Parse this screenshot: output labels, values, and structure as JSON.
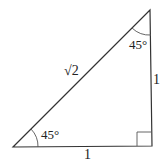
{
  "diagram": {
    "vertices": {
      "bottom_left": [
        13,
        147
      ],
      "bottom_right": [
        152,
        146
      ],
      "top": [
        150,
        10
      ]
    },
    "labels": {
      "hypotenuse": "√2",
      "right_side": "1",
      "bottom_side": "1",
      "angle_bottom_left": "45°",
      "angle_top": "45°"
    },
    "right_angle_marker": true,
    "stroke_color": "#333333"
  }
}
